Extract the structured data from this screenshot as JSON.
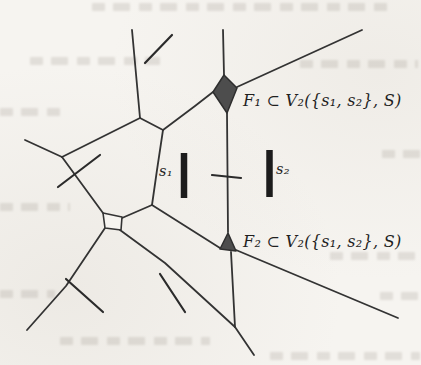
{
  "figure": {
    "caption_labels": {
      "f1": "F₁ ⊂ V₂({s₁, s₂}, S)",
      "f2": "F₂ ⊂ V₂({s₁, s₂}, S)",
      "s1": "s₁",
      "s2": "s₂"
    },
    "colors": {
      "edge": "#333333",
      "site_segment": "#2b2b2b",
      "site_bar": "#1c1c1c",
      "shaded_face_fill": "#4d4d4d",
      "paper_background": "#f6f4f0"
    },
    "faces": [
      {
        "name": "face-f1-shaded",
        "points": "224,75 237,88 227,113 213,92"
      },
      {
        "name": "face-f2-shaded",
        "points": "228,233 220,249 236,251"
      }
    ],
    "quad_faces": [
      {
        "name": "small-quad-face",
        "points": "103,213 122,217 121,230 105,228"
      }
    ],
    "edges": [
      {
        "name": "voronoi-edge",
        "points": "132,30 140,118"
      },
      {
        "name": "voronoi-edge",
        "points": "140,118 163,130"
      },
      {
        "name": "voronoi-edge",
        "points": "140,118 62,157"
      },
      {
        "name": "voronoi-edge",
        "points": "25,140 62,157"
      },
      {
        "name": "voronoi-edge",
        "points": "62,157 103,213"
      },
      {
        "name": "voronoi-edge",
        "points": "163,130 195,106 213,92"
      },
      {
        "name": "voronoi-edge",
        "points": "163,130 157,170 152,205"
      },
      {
        "name": "voronoi-edge",
        "points": "152,205 122,218"
      },
      {
        "name": "voronoi-edge",
        "points": "152,205 220,248"
      },
      {
        "name": "voronoi-edge",
        "points": "223,30 224,75"
      },
      {
        "name": "voronoi-edge",
        "points": "362,30 237,87"
      },
      {
        "name": "voronoi-edge",
        "points": "227,113 228,232"
      },
      {
        "name": "voronoi-edge",
        "points": "236,250 398,318"
      },
      {
        "name": "voronoi-edge",
        "points": "231,252 235,327"
      },
      {
        "name": "voronoi-edge",
        "points": "120,230 165,263 235,327"
      },
      {
        "name": "voronoi-edge",
        "points": "105,228 66,286 27,330"
      },
      {
        "name": "voronoi-edge",
        "points": "235,327 254,355"
      },
      {
        "name": "voronoi-edge-double",
        "points": "106,225.5 120,227.5"
      }
    ],
    "site_segments": [
      {
        "name": "site-segment",
        "points": "145,63 172,35"
      },
      {
        "name": "site-segment",
        "points": "58,187 100,155"
      },
      {
        "name": "site-segment",
        "points": "66,279 103,312"
      },
      {
        "name": "site-segment",
        "points": "160,274 185,312"
      },
      {
        "name": "site-segment-tick",
        "points": "212,175 241,178"
      }
    ],
    "site_bars": [
      {
        "name": "site-bar-s1",
        "points": "184,153 184,198"
      },
      {
        "name": "site-bar-s2",
        "points": "269.5,150 269.5,197"
      }
    ]
  }
}
